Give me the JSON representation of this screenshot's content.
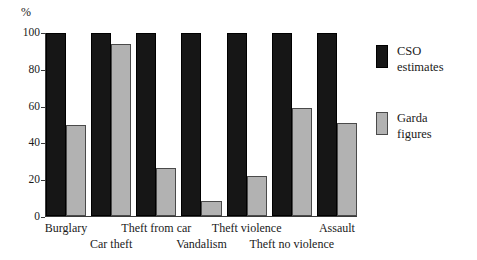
{
  "chart_data": {
    "type": "bar",
    "title": "",
    "subtitle": "",
    "xlabel": "",
    "ylabel": "%",
    "ylim": [
      0,
      100
    ],
    "yticks": [
      0,
      20,
      40,
      60,
      80,
      100
    ],
    "ytick_labels": [
      "0",
      "20",
      "40",
      "60",
      "80",
      "100"
    ],
    "grid": false,
    "legend_position": "right",
    "categories": [
      "Burglary",
      "Car theft",
      "Theft from car",
      "Vandalism",
      "Theft violence",
      "Theft no violence",
      "Assault"
    ],
    "category_rows": [
      0,
      1,
      0,
      1,
      0,
      1,
      0
    ],
    "series": [
      {
        "name": "CSO estimates",
        "color": "#161616",
        "values": [
          100,
          100,
          100,
          100,
          100,
          100,
          100
        ]
      },
      {
        "name": "Garda figures",
        "color": "#b2b2b2",
        "values": [
          50,
          94,
          26,
          8,
          22,
          59,
          51
        ]
      }
    ]
  },
  "axis": {
    "unit_label": "%"
  },
  "legend": {
    "items": [
      {
        "label_line1": "CSO",
        "label_line2": "estimates",
        "swatch": "cso"
      },
      {
        "label_line1": "Garda",
        "label_line2": "figures",
        "swatch": "garda"
      }
    ]
  }
}
